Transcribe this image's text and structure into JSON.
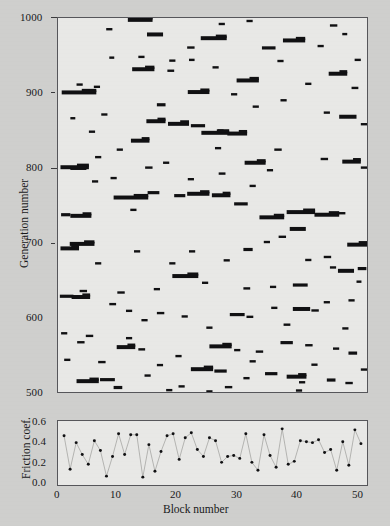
{
  "figure": {
    "background_color": "#cfcfcd",
    "panel_color": "#e8e8e6",
    "ink_color": "#101012",
    "frame_color": "#56565a"
  },
  "chart_data": [
    {
      "id": "generation-block-map",
      "type": "scatter",
      "title": "",
      "xlabel": "",
      "ylabel": "Generation number",
      "xlim": [
        0,
        50
      ],
      "ylim": [
        500,
        1000
      ],
      "grid": false,
      "legend": null,
      "ytick_labels": [
        "500",
        "600",
        "700",
        "800",
        "900",
        "1000"
      ],
      "ytick_values": [
        500,
        600,
        700,
        800,
        900,
        1000
      ],
      "yminor_values": [
        550,
        650,
        750,
        850,
        950
      ],
      "xtick_labels": [],
      "marker": "horizontal-bar-segment",
      "description": "Black horizontal bar segments marking active block spans per generation",
      "segments": [
        [
          0.6,
          900.5,
          5.6
        ],
        [
          5.8,
          908.0,
          1.0
        ],
        [
          8.3,
          947.0,
          0.8
        ],
        [
          11.3,
          997.5,
          4.0
        ],
        [
          14.4,
          978.0,
          2.6
        ],
        [
          12.0,
          931.5,
          3.6
        ],
        [
          17.7,
          929.5,
          1.1
        ],
        [
          20.9,
          960.5,
          1.2
        ],
        [
          23.1,
          973.0,
          4.2
        ],
        [
          21.0,
          901.0,
          3.5
        ],
        [
          21.2,
          944.0,
          0.9
        ],
        [
          28.9,
          916.5,
          3.6
        ],
        [
          25.7,
          849.5,
          1.1
        ],
        [
          16.0,
          884.0,
          1.4
        ],
        [
          14.3,
          862.0,
          3.1
        ],
        [
          17.8,
          858.5,
          3.4
        ],
        [
          21.5,
          856.0,
          2.3
        ],
        [
          23.2,
          846.5,
          4.5
        ],
        [
          27.4,
          845.5,
          3.2
        ],
        [
          11.8,
          836.0,
          3.0
        ],
        [
          25.4,
          826.0,
          1.0
        ],
        [
          30.2,
          806.5,
          3.4
        ],
        [
          0.4,
          800.5,
          4.6
        ],
        [
          2.0,
          799.5,
          2.6
        ],
        [
          14.1,
          800.0,
          1.2
        ],
        [
          21.0,
          784.5,
          1.0
        ],
        [
          14.5,
          766.5,
          1.9
        ],
        [
          9.0,
          760.0,
          5.6
        ],
        [
          18.8,
          762.5,
          1.8
        ],
        [
          20.9,
          765.0,
          3.6
        ],
        [
          24.9,
          763.0,
          3.0
        ],
        [
          28.5,
          751.5,
          2.2
        ],
        [
          11.7,
          743.5,
          1.0
        ],
        [
          0.5,
          737.0,
          1.5
        ],
        [
          2.0,
          735.5,
          3.4
        ],
        [
          32.6,
          733.5,
          4.0
        ],
        [
          1.9,
          698.0,
          4.0
        ],
        [
          0.4,
          692.0,
          3.0
        ],
        [
          21.2,
          688.0,
          1.0
        ],
        [
          30.0,
          690.5,
          1.5
        ],
        [
          37.0,
          740.5,
          4.6
        ],
        [
          41.5,
          737.0,
          4.0
        ],
        [
          45.3,
          739.0,
          1.2
        ],
        [
          37.5,
          718.0,
          2.6
        ],
        [
          35.7,
          707.5,
          1.2
        ],
        [
          33.3,
          700.5,
          1.0
        ],
        [
          46.8,
          697.0,
          3.2
        ],
        [
          40.0,
          676.5,
          1.0
        ],
        [
          44.0,
          666.5,
          1.0
        ],
        [
          45.3,
          662.0,
          2.6
        ],
        [
          48.5,
          665.0,
          1.4
        ],
        [
          48.3,
          647.5,
          0.8
        ],
        [
          38.0,
          643.0,
          2.4
        ],
        [
          34.3,
          640.5,
          1.0
        ],
        [
          30.0,
          638.5,
          1.1
        ],
        [
          18.5,
          655.0,
          4.2
        ],
        [
          23.3,
          646.0,
          1.0
        ],
        [
          15.5,
          637.5,
          1.0
        ],
        [
          9.6,
          633.0,
          1.2
        ],
        [
          3.5,
          635.0,
          1.2
        ],
        [
          0.3,
          628.0,
          2.2
        ],
        [
          2.2,
          627.0,
          3.0
        ],
        [
          47.0,
          622.5,
          1.0
        ],
        [
          8.3,
          617.5,
          1.1
        ],
        [
          11.0,
          608.5,
          1.0
        ],
        [
          16.0,
          605.5,
          1.2
        ],
        [
          20.0,
          601.0,
          1.0
        ],
        [
          27.8,
          603.5,
          2.4
        ],
        [
          30.5,
          600.5,
          1.1
        ],
        [
          34.5,
          612.5,
          1.0
        ],
        [
          38.0,
          611.0,
          2.8
        ],
        [
          41.0,
          609.0,
          1.2
        ],
        [
          43.0,
          620.0,
          1.0
        ],
        [
          0.5,
          578.5,
          1.0
        ],
        [
          4.5,
          575.0,
          1.2
        ],
        [
          3.1,
          566.5,
          1.2
        ],
        [
          9.5,
          560.0,
          3.0
        ],
        [
          13.0,
          557.0,
          1.1
        ],
        [
          24.5,
          561.0,
          3.6
        ],
        [
          28.5,
          556.0,
          1.0
        ],
        [
          32.0,
          554.0,
          1.2
        ],
        [
          36.0,
          566.0,
          2.0
        ],
        [
          40.0,
          562.5,
          1.2
        ],
        [
          44.5,
          558.0,
          1.0
        ],
        [
          47.0,
          552.0,
          1.4
        ],
        [
          1.0,
          543.0,
          1.0
        ],
        [
          6.5,
          540.0,
          1.2
        ],
        [
          16.0,
          536.0,
          1.0
        ],
        [
          21.5,
          530.5,
          3.6
        ],
        [
          25.3,
          528.0,
          2.0
        ],
        [
          33.5,
          524.5,
          2.0
        ],
        [
          37.0,
          520.5,
          3.2
        ],
        [
          43.5,
          516.0,
          1.4
        ],
        [
          46.5,
          512.0,
          1.2
        ],
        [
          3.0,
          514.5,
          3.6
        ],
        [
          6.8,
          516.5,
          2.4
        ],
        [
          9.0,
          506.0,
          1.4
        ],
        [
          19.5,
          507.5,
          1.0
        ],
        [
          27.0,
          506.5,
          1.2
        ],
        [
          39.0,
          513.0,
          1.0
        ],
        [
          2.0,
          866.0,
          0.8
        ],
        [
          7.0,
          871.0,
          1.0
        ],
        [
          33.0,
          960.0,
          2.2
        ],
        [
          36.4,
          970.0,
          3.6
        ],
        [
          42.0,
          962.5,
          1.0
        ],
        [
          44.0,
          990.0,
          1.2
        ],
        [
          46.0,
          978.5,
          0.8
        ],
        [
          43.8,
          925.5,
          3.0
        ],
        [
          40.0,
          912.0,
          1.0
        ],
        [
          47.5,
          906.5,
          1.1
        ],
        [
          36.0,
          890.0,
          1.0
        ],
        [
          31.5,
          881.5,
          1.0
        ],
        [
          43.0,
          873.5,
          1.0
        ],
        [
          45.5,
          868.0,
          2.8
        ],
        [
          49.0,
          858.0,
          1.0
        ],
        [
          35.0,
          824.0,
          1.2
        ],
        [
          42.5,
          811.5,
          1.2
        ],
        [
          46.0,
          808.0,
          3.0
        ],
        [
          49.0,
          800.0,
          1.0
        ],
        [
          33.8,
          796.5,
          1.0
        ],
        [
          8.5,
          786.0,
          1.0
        ],
        [
          5.5,
          781.5,
          1.0
        ],
        [
          31.0,
          775.5,
          1.0
        ],
        [
          26.0,
          792.0,
          1.1
        ],
        [
          17.0,
          806.5,
          1.0
        ],
        [
          6.0,
          814.0,
          1.0
        ],
        [
          9.5,
          824.0,
          1.0
        ],
        [
          5.0,
          848.0,
          1.0
        ],
        [
          3.0,
          911.0,
          1.0
        ],
        [
          7.8,
          985.0,
          1.0
        ],
        [
          26.0,
          992.0,
          1.0
        ],
        [
          30.5,
          996.0,
          1.0
        ],
        [
          18.0,
          943.0,
          1.0
        ],
        [
          13.0,
          948.0,
          1.0
        ],
        [
          25.0,
          934.0,
          1.0
        ],
        [
          28.0,
          898.0,
          1.0
        ],
        [
          35.5,
          942.5,
          1.0
        ],
        [
          48.0,
          944.0,
          1.0
        ],
        [
          12.3,
          688.0,
          1.0
        ],
        [
          6.0,
          672.0,
          1.0
        ],
        [
          18.0,
          672.0,
          1.0
        ],
        [
          26.8,
          676.0,
          1.0
        ],
        [
          43.0,
          680.5,
          1.2
        ],
        [
          13.5,
          596.0,
          1.0
        ],
        [
          24.0,
          586.0,
          1.0
        ],
        [
          36.5,
          590.0,
          1.1
        ],
        [
          46.0,
          585.0,
          1.0
        ],
        [
          11.0,
          572.0,
          1.0
        ],
        [
          19.0,
          548.0,
          1.0
        ],
        [
          31.0,
          541.0,
          1.0
        ],
        [
          41.0,
          536.5,
          1.0
        ],
        [
          49.0,
          530.0,
          1.0
        ],
        [
          14.0,
          522.0,
          1.0
        ],
        [
          30.0,
          518.5,
          1.0
        ],
        [
          17.5,
          502.5,
          1.0
        ],
        [
          24.0,
          500.8,
          1.0
        ],
        [
          38.5,
          502.0,
          1.0
        ]
      ]
    },
    {
      "id": "friction-coefficient",
      "type": "line",
      "title": "",
      "xlabel": "Block number",
      "ylabel": "Friction coef.",
      "xlim": [
        0,
        51
      ],
      "ylim": [
        0.0,
        0.65
      ],
      "grid": false,
      "legend": null,
      "marker": "filled-circle",
      "ytick_labels": [
        "0.0",
        "0.2",
        "0.4",
        "0.6"
      ],
      "ytick_values": [
        0.0,
        0.2,
        0.4,
        0.6
      ],
      "xtick_labels": [
        "0",
        "10",
        "20",
        "30",
        "40",
        "50"
      ],
      "xtick_values": [
        0,
        10,
        20,
        30,
        40,
        50
      ],
      "x": [
        1,
        2,
        3,
        4,
        5,
        6,
        7,
        8,
        9,
        10,
        11,
        12,
        13,
        14,
        15,
        16,
        17,
        18,
        19,
        20,
        21,
        22,
        23,
        24,
        25,
        26,
        27,
        28,
        29,
        30,
        31,
        32,
        33,
        34,
        35,
        36,
        37,
        38,
        39,
        40,
        41,
        42,
        43,
        44,
        45,
        46,
        47,
        48,
        49,
        50
      ],
      "values": [
        0.5,
        0.16,
        0.43,
        0.31,
        0.21,
        0.45,
        0.35,
        0.09,
        0.29,
        0.52,
        0.31,
        0.51,
        0.51,
        0.08,
        0.41,
        0.14,
        0.34,
        0.5,
        0.52,
        0.26,
        0.48,
        0.53,
        0.36,
        0.29,
        0.48,
        0.45,
        0.23,
        0.29,
        0.3,
        0.27,
        0.52,
        0.23,
        0.15,
        0.51,
        0.3,
        0.18,
        0.57,
        0.21,
        0.24,
        0.45,
        0.44,
        0.43,
        0.46,
        0.33,
        0.36,
        0.15,
        0.44,
        0.2,
        0.56,
        0.42
      ]
    }
  ],
  "labels": {
    "main_ylabel": "Generation number",
    "lower_ylabel": "Friction coef.",
    "lower_xlabel": "Block number"
  }
}
